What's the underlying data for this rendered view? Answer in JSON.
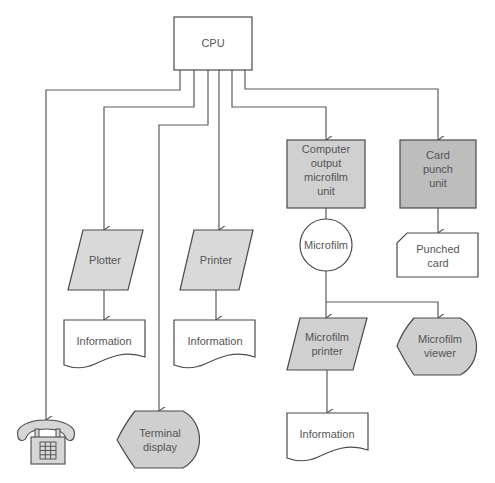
{
  "colors": {
    "line": "#5a5a5a",
    "fill_light": "#d9d9d9",
    "fill_dark": "#c4c4c4",
    "white": "#ffffff",
    "text": "#555555"
  },
  "nodes": {
    "cpu": {
      "label": "CPU",
      "shape": "rectangle"
    },
    "plotter": {
      "label": "Plotter",
      "shape": "parallelogram"
    },
    "printer": {
      "label": "Printer",
      "shape": "parallelogram"
    },
    "com": {
      "line1": "Computer",
      "line2": "output",
      "line3": "microfilm",
      "line4": "unit",
      "shape": "rectangle"
    },
    "card_punch": {
      "line1": "Card",
      "line2": "punch",
      "line3": "unit",
      "shape": "rectangle"
    },
    "microfilm": {
      "label": "Microfilm",
      "shape": "circle"
    },
    "punched_card": {
      "line1": "Punched",
      "line2": "card",
      "shape": "card"
    },
    "info_plotter": {
      "label": "Information",
      "shape": "document"
    },
    "info_printer": {
      "label": "Information",
      "shape": "document"
    },
    "microfilm_printer": {
      "line1": "Microfilm",
      "line2": "printer",
      "shape": "parallelogram"
    },
    "microfilm_viewer": {
      "line1": "Microfilm",
      "line2": "viewer",
      "shape": "display"
    },
    "info_microfilm": {
      "label": "Information",
      "shape": "document"
    },
    "terminal_display": {
      "line1": "Terminal",
      "line2": "display",
      "shape": "display"
    },
    "telephone": {
      "icon": "telephone-icon"
    }
  },
  "edges": [
    [
      "cpu",
      "telephone"
    ],
    [
      "cpu",
      "plotter"
    ],
    [
      "cpu",
      "terminal_display"
    ],
    [
      "cpu",
      "printer"
    ],
    [
      "cpu",
      "com"
    ],
    [
      "cpu",
      "card_punch"
    ],
    [
      "plotter",
      "info_plotter"
    ],
    [
      "printer",
      "info_printer"
    ],
    [
      "com",
      "microfilm"
    ],
    [
      "card_punch",
      "punched_card"
    ],
    [
      "microfilm",
      "microfilm_printer"
    ],
    [
      "microfilm",
      "microfilm_viewer"
    ],
    [
      "microfilm_printer",
      "info_microfilm"
    ]
  ]
}
